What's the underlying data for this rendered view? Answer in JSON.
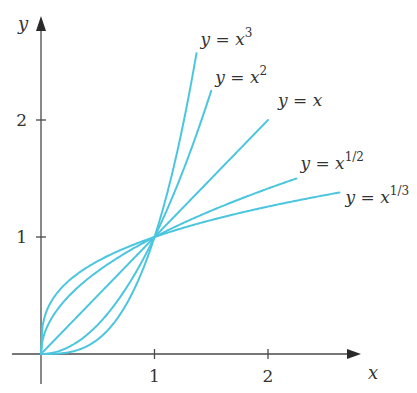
{
  "chart_data": {
    "type": "line",
    "title": "",
    "xlabel": "x",
    "ylabel": "y",
    "xlim": [
      -0.3,
      3.2
    ],
    "ylim": [
      -0.3,
      3.0
    ],
    "grid": false,
    "legend": "inline-labels-at-curve-ends",
    "x_ticks": [
      {
        "value": 1,
        "label": "1"
      },
      {
        "value": 2,
        "label": "2"
      }
    ],
    "y_ticks": [
      {
        "value": 1,
        "label": "1"
      },
      {
        "value": 2,
        "label": "2"
      }
    ],
    "color": "#4cc6df",
    "series": [
      {
        "name": "y = x^3",
        "label_base": "y = x",
        "label_exp": "3",
        "power": 3,
        "x_range": [
          0,
          1.37
        ]
      },
      {
        "name": "y = x^2",
        "label_base": "y = x",
        "label_exp": "2",
        "power": 2,
        "x_range": [
          0,
          1.5
        ]
      },
      {
        "name": "y = x",
        "label_base": "y = x",
        "label_exp": "",
        "power": 1,
        "x_range": [
          0,
          2.0
        ]
      },
      {
        "name": "y = x^(1/2)",
        "label_base": "y = x",
        "label_exp": "1/2",
        "power": 0.5,
        "x_range": [
          0,
          2.25
        ]
      },
      {
        "name": "y = x^(1/3)",
        "label_base": "y = x",
        "label_exp": "1/3",
        "power": 0.3333333,
        "x_range": [
          0,
          2.63
        ]
      }
    ]
  }
}
